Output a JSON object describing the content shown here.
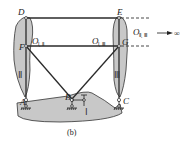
{
  "diagram": {
    "nodes": {
      "A": "A",
      "B": "B",
      "C": "C",
      "D": "D",
      "E": "E",
      "F": "F",
      "G": "G"
    },
    "bodies": {
      "I": "Ⅰ",
      "II": "Ⅱ",
      "III": "Ⅲ"
    },
    "centers": {
      "o_1_2": {
        "main": "O",
        "sub": "Ⅰ, Ⅱ"
      },
      "o_1_3": {
        "main": "O",
        "sub": "Ⅰ, Ⅲ"
      },
      "o_2_3": {
        "main": "O",
        "sub": "Ⅱ, Ⅲ"
      }
    },
    "infinity": "∞",
    "caption": "(b)",
    "colors": {
      "fill": "#c8c8c8",
      "line": "#2a2a2a"
    }
  }
}
